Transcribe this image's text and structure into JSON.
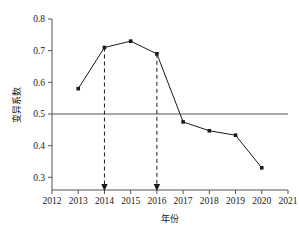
{
  "chart_data": {
    "type": "line",
    "title": "",
    "xlabel": "年份",
    "ylabel": "变异系数",
    "x": [
      2013,
      2014,
      2015,
      2016,
      2017,
      2018,
      2019,
      2020
    ],
    "values": [
      0.58,
      0.71,
      0.73,
      0.69,
      0.475,
      0.447,
      0.433,
      0.33
    ],
    "series": [
      {
        "name": "变异系数",
        "x": [
          2013,
          2014,
          2015,
          2016,
          2017,
          2018,
          2019,
          2020
        ],
        "values": [
          0.58,
          0.71,
          0.73,
          0.69,
          0.475,
          0.447,
          0.433,
          0.33
        ]
      }
    ],
    "xlim": [
      2012,
      2021
    ],
    "ylim": [
      0.26,
      0.8
    ],
    "xticks": [
      2012,
      2013,
      2014,
      2015,
      2016,
      2017,
      2018,
      2019,
      2020,
      2021
    ],
    "xtick_labels": [
      "2012",
      "2013",
      "2014",
      "2015",
      "2016",
      "2017",
      "2018",
      "2019",
      "2020",
      "2021"
    ],
    "yticks": [
      0.3,
      0.4,
      0.5,
      0.6,
      0.7,
      0.8
    ],
    "ytick_labels": [
      "0.3",
      "0.4",
      "0.5",
      "0.6",
      "0.7",
      "0.8"
    ],
    "grid": false,
    "legend": null,
    "marker": "square",
    "line_color": "#1a1a1a",
    "marker_color": "#1a1a1a",
    "reference_lines": [
      {
        "orientation": "horizontal",
        "value": 0.5,
        "style": "solid",
        "color": "#555555"
      }
    ],
    "annotations": [
      {
        "type": "vertical-dashed-arrow",
        "x": 2014,
        "from_value": 0.71,
        "to_value": 0.26,
        "arrow": "down",
        "style": "dashed",
        "color": "#1a1a1a"
      },
      {
        "type": "vertical-dashed-arrow",
        "x": 2016,
        "from_value": 0.69,
        "to_value": 0.26,
        "arrow": "down",
        "style": "dashed",
        "color": "#1a1a1a"
      }
    ]
  }
}
